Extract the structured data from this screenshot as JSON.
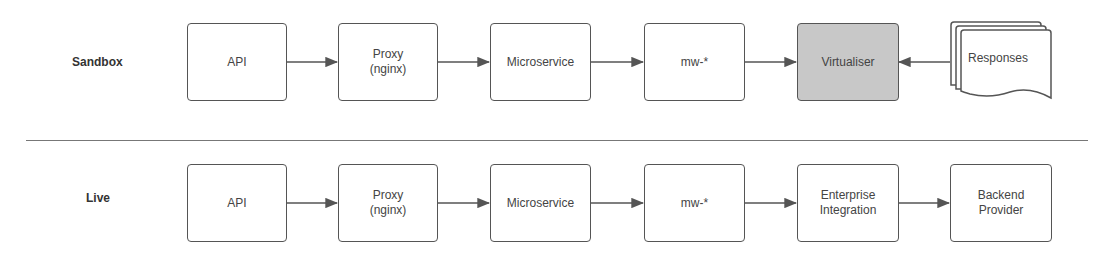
{
  "rows": [
    {
      "label": "Sandbox",
      "nodes": [
        {
          "label": "API"
        },
        {
          "label": "Proxy\n(nginx)"
        },
        {
          "label": "Microservice"
        },
        {
          "label": "mw-*"
        },
        {
          "label": "Virtualiser",
          "shaded": true
        },
        {
          "label": "Responses",
          "shape": "multi-document"
        }
      ],
      "edges": [
        "API→Proxy",
        "Proxy→Microservice",
        "Microservice→mw-*",
        "mw-*→Virtualiser",
        "Responses→Virtualiser"
      ]
    },
    {
      "label": "Live",
      "nodes": [
        {
          "label": "API"
        },
        {
          "label": "Proxy\n(nginx)"
        },
        {
          "label": "Microservice"
        },
        {
          "label": "mw-*"
        },
        {
          "label": "Enterprise\nIntegration"
        },
        {
          "label": "Backend\nProvider"
        }
      ],
      "edges": [
        "API→Proxy",
        "Proxy→Microservice",
        "Microservice→mw-*",
        "mw-*→Enterprise Integration",
        "Enterprise Integration→Backend Provider"
      ]
    }
  ],
  "colors": {
    "stroke": "#555555",
    "shaded_fill": "#c8c8c8"
  }
}
